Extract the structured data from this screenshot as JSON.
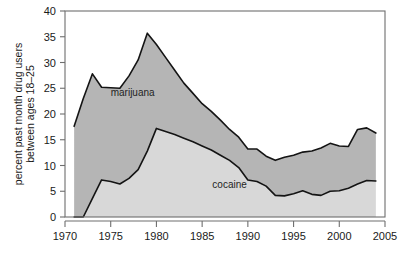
{
  "chart_data": {
    "type": "area",
    "title": "",
    "subtitle": "",
    "xlabel": "",
    "ylabel_line1": "percent past month drug users",
    "ylabel_line2": "between ages 18–25",
    "xlim": [
      1970,
      2005
    ],
    "ylim": [
      0,
      40
    ],
    "xticks": [
      1970,
      1975,
      1980,
      1985,
      1990,
      1995,
      2000,
      2005
    ],
    "yticks": [
      0,
      5,
      10,
      15,
      20,
      25,
      30,
      35,
      40
    ],
    "grid": false,
    "legend_position": "inline-annotations",
    "stacked": false,
    "annotations": [
      {
        "label": "marijuana",
        "x": 1977.4,
        "y": 23.5
      },
      {
        "label": "cocaine",
        "x": 1988.0,
        "y": 5.6
      }
    ],
    "x": [
      1971,
      1972,
      1973,
      1974,
      1975,
      1976,
      1977,
      1978,
      1979,
      1980,
      1981,
      1982,
      1983,
      1984,
      1985,
      1986,
      1987,
      1988,
      1989,
      1990,
      1991,
      1992,
      1993,
      1994,
      1995,
      1996,
      1997,
      1998,
      1999,
      2000,
      2001,
      2002,
      2003,
      2004
    ],
    "series": [
      {
        "name": "marijuana",
        "color": "#b5b5b5",
        "values": [
          17.6,
          23.0,
          27.8,
          25.2,
          25.1,
          25.0,
          27.4,
          30.5,
          35.7,
          33.5,
          31.0,
          28.5,
          26.0,
          24.0,
          22.0,
          20.5,
          18.8,
          17.0,
          15.5,
          13.2,
          13.2,
          11.8,
          11.0,
          11.6,
          12.0,
          12.6,
          12.8,
          13.4,
          14.3,
          13.8,
          13.7,
          17.0,
          17.3,
          16.3
        ]
      },
      {
        "name": "cocaine",
        "color": "#d8d8d8",
        "values": [
          0.0,
          0.0,
          3.6,
          7.2,
          6.9,
          6.4,
          7.5,
          9.2,
          12.8,
          17.2,
          16.6,
          16.0,
          15.3,
          14.6,
          13.8,
          13.0,
          12.0,
          11.0,
          9.6,
          7.2,
          6.9,
          6.0,
          4.2,
          4.1,
          4.5,
          5.1,
          4.4,
          4.2,
          5.0,
          5.1,
          5.6,
          6.4,
          7.1,
          7.0
        ]
      }
    ]
  },
  "figure": {
    "background": "#ffffff",
    "axis_color": "#6e6e6e",
    "line_color": "#141414"
  }
}
